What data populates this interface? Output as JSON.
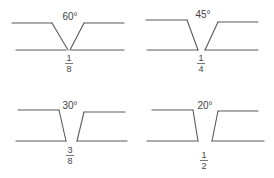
{
  "diagram": {
    "title": "",
    "line_color": "#5a5a5a",
    "text_color": "#444444",
    "panels": [
      {
        "id": "groove-60",
        "angle_label": "60°",
        "gap": {
          "numerator": "1",
          "denominator": "8"
        },
        "label_pos": {
          "x": 70,
          "y": 20
        },
        "frac_pos": {
          "x": 69,
          "num_y": 61,
          "bar_y": 63.5,
          "den_y": 72
        },
        "lines": [
          {
            "x1": 12,
            "y1": 23,
            "x2": 52,
            "y2": 23
          },
          {
            "x1": 52,
            "y1": 23,
            "x2": 68,
            "y2": 50
          },
          {
            "x1": 16,
            "y1": 50,
            "x2": 66,
            "y2": 50
          },
          {
            "x1": 84,
            "y1": 23,
            "x2": 124,
            "y2": 23
          },
          {
            "x1": 84,
            "y1": 23,
            "x2": 70,
            "y2": 50
          },
          {
            "x1": 71,
            "y1": 50,
            "x2": 124,
            "y2": 50
          }
        ]
      },
      {
        "id": "groove-45",
        "angle_label": "45°",
        "gap": {
          "numerator": "1",
          "denominator": "4"
        },
        "label_pos": {
          "x": 203,
          "y": 18
        },
        "frac_pos": {
          "x": 201,
          "num_y": 61,
          "bar_y": 63.5,
          "den_y": 72
        },
        "lines": [
          {
            "x1": 146,
            "y1": 20,
            "x2": 187,
            "y2": 20
          },
          {
            "x1": 187,
            "y1": 20,
            "x2": 198,
            "y2": 50
          },
          {
            "x1": 147,
            "y1": 50,
            "x2": 198,
            "y2": 50
          },
          {
            "x1": 218,
            "y1": 22,
            "x2": 258,
            "y2": 22
          },
          {
            "x1": 218,
            "y1": 22,
            "x2": 205,
            "y2": 50
          },
          {
            "x1": 205,
            "y1": 50,
            "x2": 258,
            "y2": 50
          }
        ]
      },
      {
        "id": "groove-30",
        "angle_label": "30°",
        "gap": {
          "numerator": "3",
          "denominator": "8"
        },
        "label_pos": {
          "x": 70,
          "y": 109
        },
        "frac_pos": {
          "x": 70,
          "num_y": 153,
          "bar_y": 155.5,
          "den_y": 164
        },
        "lines": [
          {
            "x1": 18,
            "y1": 110,
            "x2": 59,
            "y2": 110
          },
          {
            "x1": 59,
            "y1": 110,
            "x2": 66,
            "y2": 141
          },
          {
            "x1": 16,
            "y1": 141,
            "x2": 66,
            "y2": 141
          },
          {
            "x1": 84,
            "y1": 112,
            "x2": 125,
            "y2": 112
          },
          {
            "x1": 84,
            "y1": 112,
            "x2": 77,
            "y2": 141
          },
          {
            "x1": 77,
            "y1": 141,
            "x2": 127,
            "y2": 141
          }
        ]
      },
      {
        "id": "groove-20",
        "angle_label": "20°",
        "gap": {
          "numerator": "1",
          "denominator": "2"
        },
        "label_pos": {
          "x": 205,
          "y": 109
        },
        "frac_pos": {
          "x": 204,
          "num_y": 158,
          "bar_y": 160.5,
          "den_y": 169
        },
        "lines": [
          {
            "x1": 152,
            "y1": 110,
            "x2": 193,
            "y2": 110
          },
          {
            "x1": 193,
            "y1": 110,
            "x2": 198,
            "y2": 141
          },
          {
            "x1": 147,
            "y1": 141,
            "x2": 198,
            "y2": 141
          },
          {
            "x1": 218,
            "y1": 111,
            "x2": 258,
            "y2": 111
          },
          {
            "x1": 218,
            "y1": 111,
            "x2": 212,
            "y2": 141
          },
          {
            "x1": 212,
            "y1": 141,
            "x2": 264,
            "y2": 141
          }
        ]
      }
    ]
  }
}
